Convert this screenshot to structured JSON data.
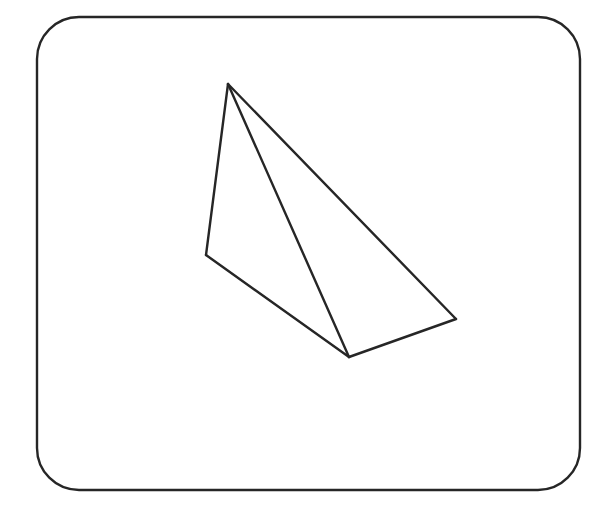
{
  "diagram": {
    "colors": {
      "stroke": "#262626",
      "background": "#ffffff"
    },
    "frame": {
      "x": 37,
      "y": 17,
      "width": 543,
      "height": 473,
      "rx": 42
    },
    "vertices": {
      "apex": [
        228,
        84
      ],
      "left": [
        206,
        255
      ],
      "bottom": [
        349,
        357
      ],
      "right": [
        456,
        319
      ]
    },
    "edges": [
      [
        "apex",
        "left"
      ],
      [
        "left",
        "bottom"
      ],
      [
        "bottom",
        "right"
      ],
      [
        "right",
        "apex"
      ],
      [
        "apex",
        "bottom"
      ]
    ]
  }
}
